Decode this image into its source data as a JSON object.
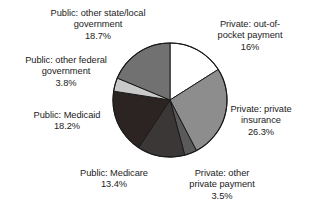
{
  "chart_data": {
    "type": "pie",
    "title": "",
    "subtitle": "",
    "xlabel": "",
    "ylabel": "",
    "grid": false,
    "legend_position": "none",
    "labels_position": "outside-callout",
    "start_angle_deg": 0,
    "direction": "clockwise",
    "categories": [
      "Private: out-of-pocket payment",
      "Private: private insurance",
      "Private: other private payment",
      "Public: Medicare",
      "Public: Medicaid",
      "Public: other federal government",
      "Public: other state/local government"
    ],
    "values": [
      16,
      26.3,
      3.5,
      13.4,
      18.2,
      3.8,
      18.7
    ],
    "value_labels": [
      "16%",
      "26.3%",
      "3.5%",
      "13.4%",
      "18.2%",
      "3.8%",
      "18.7%"
    ],
    "slice_colors": [
      "#ffffff",
      "#8d8d8d",
      "#5a5a5a",
      "#3b3736",
      "#2b2422",
      "#c9c9c9",
      "#717171"
    ],
    "stroke_color": "#1a1a1a",
    "slices": [
      {
        "name": "out-of-pocket",
        "label_line1": "Private: out-of-",
        "label_line2": "pocket payment",
        "value_text": "16%",
        "value": 16,
        "color": "#ffffff"
      },
      {
        "name": "private-insurance",
        "label_line1": "Private: private",
        "label_line2": "insurance",
        "value_text": "26.3%",
        "value": 26.3,
        "color": "#8d8d8d"
      },
      {
        "name": "other-private-payment",
        "label_line1": "Private: other",
        "label_line2": "private payment",
        "value_text": "3.5%",
        "value": 3.5,
        "color": "#5a5a5a"
      },
      {
        "name": "medicare",
        "label_line1": "Public: Medicare",
        "label_line2": "",
        "value_text": "13.4%",
        "value": 13.4,
        "color": "#3b3736"
      },
      {
        "name": "medicaid",
        "label_line1": "Public: Medicaid",
        "label_line2": "",
        "value_text": "18.2%",
        "value": 18.2,
        "color": "#2b2422"
      },
      {
        "name": "other-federal-government",
        "label_line1": "Public: other federal",
        "label_line2": "government",
        "value_text": "3.8%",
        "value": 3.8,
        "color": "#c9c9c9"
      },
      {
        "name": "other-state-local-government",
        "label_line1": "Public: other state/local",
        "label_line2": "government",
        "value_text": "18.7%",
        "value": 18.7,
        "color": "#717171"
      }
    ]
  },
  "labels": {
    "state_local": "Public: other state/local\ngovernment\n18.7%",
    "out_of_pocket": "Private: out-of-\npocket payment\n16%",
    "other_federal": "Public: other federal\ngovernment\n3.8%",
    "medicaid": "Public: Medicaid\n18.2%",
    "private_insurance": "Private: private\ninsurance\n26.3%",
    "medicare": "Public: Medicare\n13.4%",
    "other_private": "Private: other\nprivate payment\n3.5%"
  }
}
